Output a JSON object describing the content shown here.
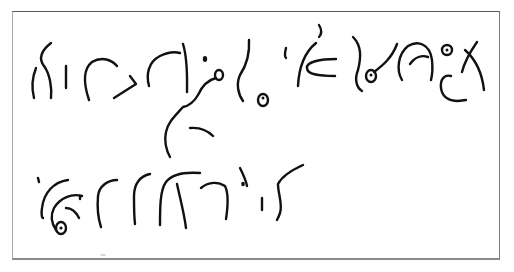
{
  "image": {
    "description": "Scanned handwritten script sample in a rectangular frame",
    "ink_color": "#111111",
    "background_color": "#ffffff",
    "frame_color": "#7a7a7a"
  },
  "rows": [
    {
      "label": "line-1",
      "stroke_count": 22
    },
    {
      "label": "line-2",
      "stroke_count": 12
    }
  ]
}
